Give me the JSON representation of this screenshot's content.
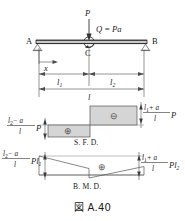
{
  "figure": {
    "caption": "図 A.40",
    "title_symbol": "図",
    "number": "A.40"
  },
  "beam": {
    "support_left_label": "A",
    "support_right_label": "B",
    "hinge_label": "C",
    "point_load_label": "P",
    "moment_label": "Q = Pa",
    "distance_label": "x",
    "dim_left": "l",
    "dim_left_sub": "1",
    "dim_right": "l",
    "dim_right_sub": "2",
    "dim_total": "l"
  },
  "sfd": {
    "name": "S. F. D.",
    "left_value": {
      "numerator": "l₂ − a",
      "numerator_main": "l",
      "numerator_sub": "2",
      "numerator_rest": "− a",
      "denominator": "l",
      "factor": "P",
      "sign": "⊕"
    },
    "right_value": {
      "numerator_main": "l",
      "numerator_sub": "1",
      "numerator_rest": "+ a",
      "denominator": "l",
      "factor": "P",
      "sign": "⊖"
    }
  },
  "bmd": {
    "name": "B. M. D.",
    "left_value": {
      "numerator_main": "l",
      "numerator_sub": "2",
      "numerator_rest": "− a",
      "denominator": "l",
      "factor": "Pl",
      "factor_sub": "1"
    },
    "right_value": {
      "numerator_main": "l",
      "numerator_sub": "1",
      "numerator_rest": "+ a",
      "denominator": "l",
      "factor": "Pl",
      "factor_sub": "2"
    },
    "sign": "⊕"
  },
  "colors": {
    "ink": "#1a1a1a",
    "line": "#555555",
    "fill": "#d5d5d5",
    "beam": "#c9c9c9",
    "axis": "#8a8a8a"
  }
}
